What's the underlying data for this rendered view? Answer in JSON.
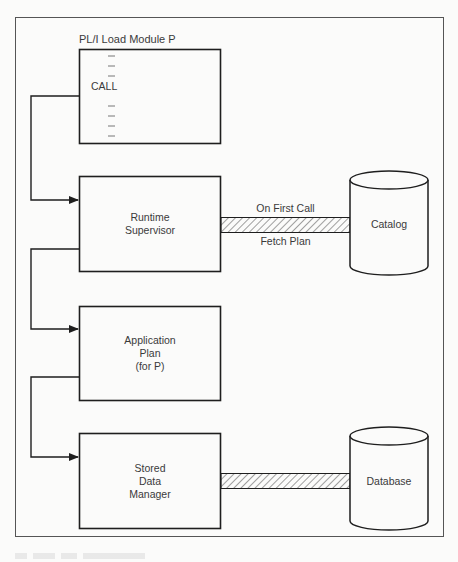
{
  "diagram": {
    "load_module": {
      "title": "PL/I Load Module P",
      "call_label": "CALL"
    },
    "runtime_supervisor": {
      "line1": "Runtime",
      "line2": "Supervisor"
    },
    "application_plan": {
      "line1": "Application",
      "line2": "Plan",
      "line3": "(for P)"
    },
    "stored_data_manager": {
      "line1": "Stored",
      "line2": "Data",
      "line3": "Manager"
    },
    "catalog": {
      "label": "Catalog"
    },
    "database": {
      "label": "Database"
    },
    "catalog_link": {
      "top_label": "On First Call",
      "bottom_label": "Fetch Plan"
    }
  },
  "colors": {
    "line": "#1e1e1e",
    "frame": "#555555",
    "text": "#3a3a3a",
    "background": "#fbfbfa"
  }
}
